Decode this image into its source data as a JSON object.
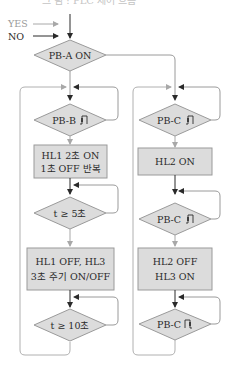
{
  "header": {
    "title_partial": "그 림 : PLC 제어 흐름"
  },
  "legend": {
    "yes_label": "YES",
    "no_label": "NO",
    "yes_color": "#a0a0a0",
    "no_color": "#404040"
  },
  "colors": {
    "shape_fill": "#dcdcdc",
    "shape_stroke": "#9a9a9a",
    "line": "#9a9a9a",
    "arrow_no": "#2a2a2a",
    "arrow_yes": "#a8a8a8"
  },
  "start": {
    "decision": "PB-A ON"
  },
  "left_branch": {
    "nodes": [
      {
        "type": "decision",
        "text": "PB-B",
        "pulse": "rising"
      },
      {
        "type": "process",
        "lines": [
          "HL1 2초 ON",
          "1초 OFF 반복"
        ]
      },
      {
        "type": "decision",
        "text": "t ≥ 5초"
      },
      {
        "type": "process",
        "lines": [
          "HL1 OFF, HL3",
          "3초 주기 ON/OFF"
        ]
      },
      {
        "type": "decision",
        "text": "t ≥ 10초"
      }
    ]
  },
  "right_branch": {
    "nodes": [
      {
        "type": "decision",
        "text": "PB-C",
        "pulse": "rising"
      },
      {
        "type": "process",
        "lines": [
          "HL2 ON"
        ]
      },
      {
        "type": "decision",
        "text": "PB-C",
        "pulse": "rising"
      },
      {
        "type": "process",
        "lines": [
          "HL2 OFF",
          "HL3 ON"
        ]
      },
      {
        "type": "decision",
        "text": "PB-C",
        "pulse": "falling"
      }
    ]
  }
}
